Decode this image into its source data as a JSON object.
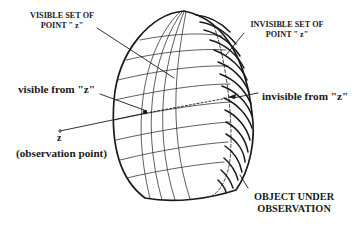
{
  "diagram": {
    "type": "illustration",
    "labels": {
      "visible_set": {
        "line1": "VISIBLE SET OF",
        "line2": "POINT \" z\""
      },
      "invisible_set": {
        "line1": "INVISIBLE SET OF",
        "line2": "POINT \" z\""
      },
      "visible_from": "visible from \"z\"",
      "invisible_from": "invisible from \"z\"",
      "observation_point_symbol": "z",
      "observation_point_caption": "(observation point)",
      "object": {
        "line1": "OBJECT UNDER",
        "line2": "OBSERVATION"
      }
    },
    "colors": {
      "ink": "#1a1a1a",
      "background": "#ffffff"
    }
  }
}
